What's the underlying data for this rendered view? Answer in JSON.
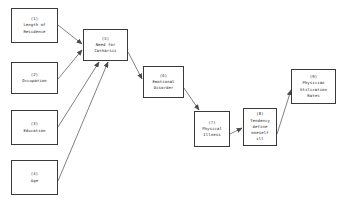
{
  "diagram": {
    "type": "path-model",
    "background_color": "#ffffff",
    "box_border_color": "#3a3a3a",
    "edge_color": "#4a4a4a",
    "text_color": "#1a1a1a",
    "nodes": [
      {
        "key": "n1",
        "id": "(1)",
        "label": "Length of\nResidence",
        "x": 11,
        "y": 8,
        "w": 47,
        "h": 35
      },
      {
        "key": "n2",
        "id": "(2)",
        "label": "Occupation",
        "x": 11,
        "y": 62,
        "w": 47,
        "h": 32
      },
      {
        "key": "n3",
        "id": "(3)",
        "label": "Education",
        "x": 11,
        "y": 110,
        "w": 47,
        "h": 35
      },
      {
        "key": "n4",
        "id": "(4)",
        "label": "Age",
        "x": 11,
        "y": 160,
        "w": 47,
        "h": 35
      },
      {
        "key": "n5",
        "id": "(5)",
        "label": "Need for\nCatharsis",
        "x": 83,
        "y": 29,
        "w": 45,
        "h": 32
      },
      {
        "key": "n6",
        "id": "(6)",
        "label": "Emotional\nDisorder",
        "x": 143,
        "y": 66,
        "w": 41,
        "h": 32
      },
      {
        "key": "n7",
        "id": "(7)",
        "label": "Physical\nIllness",
        "x": 194,
        "y": 111,
        "w": 36,
        "h": 36
      },
      {
        "key": "n8",
        "id": "(8)",
        "label": "Tendency\ndefine\noneself\nill",
        "x": 243,
        "y": 108,
        "w": 34,
        "h": 38
      },
      {
        "key": "n9",
        "id": "(9)",
        "label": "Physician\nUtilization\nRates",
        "x": 291,
        "y": 69,
        "w": 45,
        "h": 35
      }
    ],
    "edges": [
      {
        "from": "n1",
        "to": "n5",
        "x1": 58,
        "y1": 25,
        "x2": 82,
        "y2": 44
      },
      {
        "from": "n2",
        "to": "n5",
        "x1": 58,
        "y1": 79,
        "x2": 82,
        "y2": 50
      },
      {
        "from": "n3",
        "to": "n5",
        "x1": 58,
        "y1": 127,
        "x2": 99,
        "y2": 62
      },
      {
        "from": "n4",
        "to": "n5",
        "x1": 58,
        "y1": 181,
        "x2": 108,
        "y2": 62
      },
      {
        "from": "n5",
        "to": "n6",
        "x1": 128,
        "y1": 52,
        "x2": 142,
        "y2": 79
      },
      {
        "from": "n6",
        "to": "n7",
        "x1": 184,
        "y1": 88,
        "x2": 199,
        "y2": 110
      },
      {
        "from": "n7",
        "to": "n8",
        "x1": 230,
        "y1": 134,
        "x2": 242,
        "y2": 128
      },
      {
        "from": "n8",
        "to": "n9",
        "x1": 277,
        "y1": 134,
        "x2": 291,
        "y2": 90
      }
    ]
  }
}
